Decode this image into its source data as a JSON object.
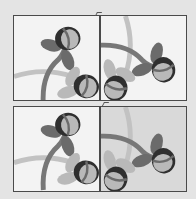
{
  "image": {
    "description": "2x2 grid of square tiles, each showing a stylized two-flower vine motif in grayscale, arranged in different rotations",
    "colors": {
      "page_background": "#e4e4e4",
      "tile_light_background": "#f3f3f3",
      "tile_gray_background": "#d9d9d9",
      "border": "#4a4a4a",
      "petal_dark": "#2f2f2f",
      "petal_mid": "#6b6b6b",
      "petal_light": "#b9b9b9",
      "stem": "#777777",
      "band": "#bfbfbf"
    },
    "tiles": [
      {
        "position": "top-left",
        "background": "light",
        "rotation": 0
      },
      {
        "position": "top-right",
        "background": "light",
        "rotation": 90
      },
      {
        "position": "bottom-left",
        "background": "light",
        "rotation": 0
      },
      {
        "position": "bottom-right",
        "background": "gray",
        "rotation": 90
      }
    ]
  }
}
